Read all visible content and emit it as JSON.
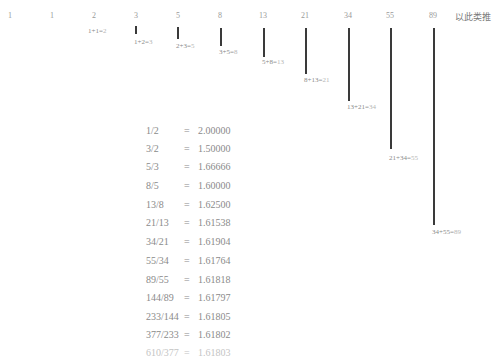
{
  "sequence": {
    "numbers": [
      "1",
      "1",
      "2",
      "3",
      "5",
      "8",
      "13",
      "21",
      "34",
      "55",
      "89"
    ],
    "etc_label": "以此类推"
  },
  "sums": [
    {
      "expr": "1+1=",
      "result": "2"
    },
    {
      "expr": "1+2=",
      "result": "3"
    },
    {
      "expr": "2+3=",
      "result": "5"
    },
    {
      "expr": "3+5=",
      "result": "8"
    },
    {
      "expr": "5+8=",
      "result": "13"
    },
    {
      "expr": "8+13=",
      "result": "21"
    },
    {
      "expr": "13+21=",
      "result": "34"
    },
    {
      "expr": "21+34=",
      "result": "55"
    },
    {
      "expr": "34+55=",
      "result": "89"
    }
  ],
  "ratios": [
    {
      "fraction": "1/2",
      "eq": "=",
      "value": "2.00000"
    },
    {
      "fraction": "3/2",
      "eq": "=",
      "value": "1.50000"
    },
    {
      "fraction": "5/3",
      "eq": "=",
      "value": "1.66666"
    },
    {
      "fraction": "8/5",
      "eq": "=",
      "value": "1.60000"
    },
    {
      "fraction": "13/8",
      "eq": "=",
      "value": "1.62500"
    },
    {
      "fraction": "21/13",
      "eq": "=",
      "value": "1.61538"
    },
    {
      "fraction": "34/21",
      "eq": "=",
      "value": "1.61904"
    },
    {
      "fraction": "55/34",
      "eq": "=",
      "value": "1.61764"
    },
    {
      "fraction": "89/55",
      "eq": "=",
      "value": "1.61818"
    },
    {
      "fraction": "144/89",
      "eq": "=",
      "value": "1.61797"
    },
    {
      "fraction": "233/144",
      "eq": "=",
      "value": "1.61805"
    },
    {
      "fraction": "377/233",
      "eq": "=",
      "value": "1.61802"
    },
    {
      "fraction": "610/377",
      "eq": "=",
      "value": "1.61803"
    }
  ]
}
